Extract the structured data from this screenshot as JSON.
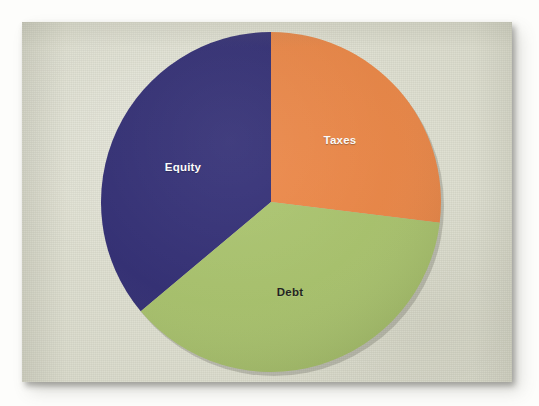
{
  "chart_data": {
    "type": "pie",
    "title": "",
    "subtitle": "",
    "xlabel": "",
    "ylabel": "",
    "legend_position": "none",
    "labels_inside_slices": true,
    "grid": false,
    "categories": [
      "Taxes",
      "Debt",
      "Equity"
    ],
    "values": [
      27,
      37,
      36
    ],
    "units": "percent",
    "start_angle_deg": 0,
    "direction": "clockwise",
    "slices": [
      {
        "label": "Taxes",
        "value": 27,
        "color": "#ea8240",
        "start_angle_deg": 0,
        "end_angle_deg": 97,
        "label_color": "#ffffff"
      },
      {
        "label": "Debt",
        "value": 37,
        "color": "#a6c167",
        "start_angle_deg": 97,
        "end_angle_deg": 230,
        "label_color": "#191919"
      },
      {
        "label": "Equity",
        "value": 36,
        "color": "#2a2570",
        "start_angle_deg": 230,
        "end_angle_deg": 360,
        "label_color": "#ffffff"
      }
    ]
  },
  "labels": {
    "taxes": "Taxes",
    "debt": "Debt",
    "equity": "Equity"
  },
  "colors": {
    "taxes": "#ea8240",
    "debt": "#a6c167",
    "equity": "#2a2570",
    "paper": "#e3e4d5",
    "surround": "#fdfdfb",
    "label_light": "#ffffff",
    "label_dark": "#191919"
  },
  "geometry": {
    "center_x": 271,
    "center_y": 202,
    "radius": 170
  }
}
